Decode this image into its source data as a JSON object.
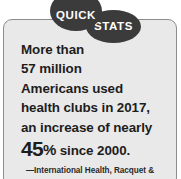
{
  "card": {
    "ribbon": {
      "badge_primary": "QUICK",
      "badge_secondary": "STATS"
    },
    "colors": {
      "card_background": "#e9e9e9",
      "card_border": "#8d8d8d",
      "badge_fill": "#3b3b3b",
      "badge_text": "#ffffff",
      "body_text": "#1d1d1d",
      "page_background": "#ffffff"
    },
    "statement": {
      "lines": [
        "More than",
        "57 million",
        "Americans used",
        "health clubs in 2017,",
        "an increase of nearly"
      ],
      "highlight": {
        "number": "45",
        "percent": "%",
        "suffix": " since 2000."
      }
    },
    "attribution": "—International Health, Racquet &"
  },
  "stats": {
    "members_millions": "57 million",
    "year": "2017",
    "growth_percent": "45%",
    "baseline_year": "2000"
  }
}
